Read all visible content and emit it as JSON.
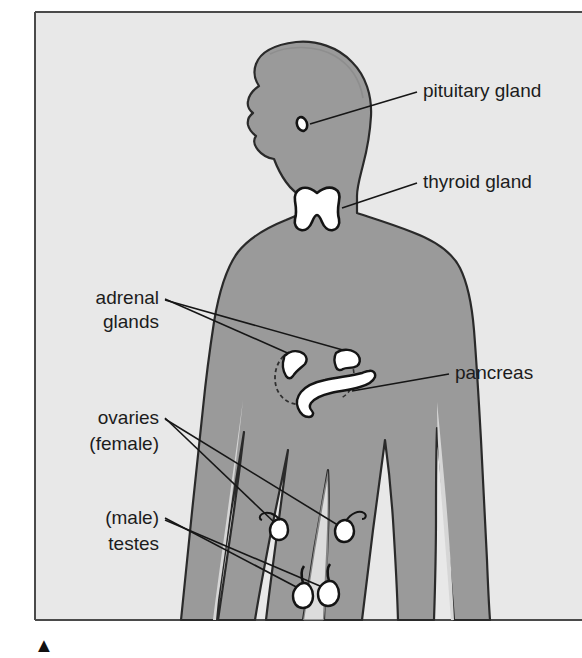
{
  "figure": {
    "background_color": "#e8e8e8",
    "body_color": "#9a9a9a",
    "body_shadow_color": "#c9c9c9",
    "organ_color": "#ffffff",
    "outline_color": "#1c1c1c",
    "page_color": "#ffffff",
    "frame_border_color": "#4a4a4a"
  },
  "labels": [
    {
      "id": "pituitary",
      "name": "pituitary-gland-label",
      "lines": [
        "pituitary gland"
      ],
      "align": "start",
      "x": 423,
      "y": 97
    },
    {
      "id": "thyroid",
      "name": "thyroid-gland-label",
      "lines": [
        "thyroid gland"
      ],
      "align": "start",
      "x": 423,
      "y": 188
    },
    {
      "id": "pancreas",
      "name": "pancreas-label",
      "lines": [
        "pancreas"
      ],
      "align": "start",
      "x": 455,
      "y": 379
    },
    {
      "id": "adrenal",
      "name": "adrenal-glands-label",
      "lines": [
        "adrenal",
        "glands"
      ],
      "align": "end",
      "x": 159,
      "y": 304
    },
    {
      "id": "ovaries",
      "name": "ovaries-label",
      "lines": [
        "ovaries",
        "(female)"
      ],
      "align": "end",
      "x": 159,
      "y": 424
    },
    {
      "id": "testes",
      "name": "testes-label",
      "lines": [
        "(male)",
        "testes"
      ],
      "align": "end",
      "x": 159,
      "y": 524
    }
  ],
  "organs": [
    {
      "id": "pituitary",
      "name": "pituitary-gland-shape",
      "label": "pituitary gland",
      "cx": 302,
      "cy": 124
    },
    {
      "id": "thyroid",
      "name": "thyroid-gland-shape",
      "label": "thyroid gland",
      "cx": 318,
      "cy": 207
    },
    {
      "id": "adrenal-left",
      "name": "adrenal-gland-left-shape",
      "label": "adrenal gland (left)",
      "cx": 297,
      "cy": 362
    },
    {
      "id": "adrenal-right",
      "name": "adrenal-gland-right-shape",
      "label": "adrenal gland (right)",
      "cx": 350,
      "cy": 361
    },
    {
      "id": "pancreas",
      "name": "pancreas-shape",
      "label": "pancreas",
      "cx": 330,
      "cy": 387
    },
    {
      "id": "ovary-left",
      "name": "ovary-left-shape",
      "label": "ovary (left)",
      "cx": 279,
      "cy": 528
    },
    {
      "id": "ovary-right",
      "name": "ovary-right-shape",
      "label": "ovary (right)",
      "cx": 346,
      "cy": 530
    },
    {
      "id": "testis-left",
      "name": "testis-left-shape",
      "label": "testis (left)",
      "cx": 304,
      "cy": 594
    },
    {
      "id": "testis-right",
      "name": "testis-right-shape",
      "label": "testis (right)",
      "cx": 329,
      "cy": 592
    }
  ],
  "leader_lines": [
    {
      "id": "pituitary-leader",
      "name": "pituitary-leader-line",
      "from": "pituitary-gland-label",
      "to": "pituitary-gland-shape"
    },
    {
      "id": "thyroid-leader",
      "name": "thyroid-leader-line",
      "from": "thyroid-gland-label",
      "to": "thyroid-gland-shape"
    },
    {
      "id": "pancreas-leader",
      "name": "pancreas-leader-line",
      "from": "pancreas-label",
      "to": "pancreas-shape"
    },
    {
      "id": "adrenal-leader-1",
      "name": "adrenal-leader-line-left",
      "from": "adrenal-glands-label",
      "to": "adrenal-gland-left-shape"
    },
    {
      "id": "adrenal-leader-2",
      "name": "adrenal-leader-line-right",
      "from": "adrenal-glands-label",
      "to": "adrenal-gland-right-shape"
    },
    {
      "id": "ovaries-leader-1",
      "name": "ovaries-leader-line-left",
      "from": "ovaries-label",
      "to": "ovary-left-shape"
    },
    {
      "id": "ovaries-leader-2",
      "name": "ovaries-leader-line-right",
      "from": "ovaries-label",
      "to": "ovary-right-shape"
    },
    {
      "id": "testes-leader-1",
      "name": "testes-leader-line-left",
      "from": "testes-label",
      "to": "testis-left-shape"
    },
    {
      "id": "testes-leader-2",
      "name": "testes-leader-line-right",
      "from": "testes-label",
      "to": "testis-right-shape"
    }
  ],
  "marker": {
    "name": "figure-caption-marker",
    "glyph": "▲"
  }
}
